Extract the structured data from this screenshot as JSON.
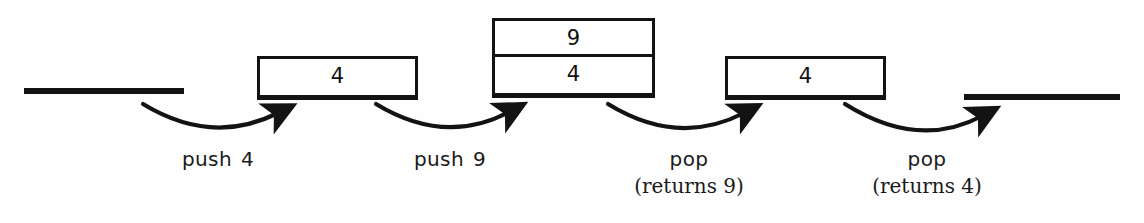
{
  "diagram": {
    "ink_color": "#131313",
    "background_color": "#ffffff",
    "states": [
      {
        "id": "empty-start",
        "kind": "baseline",
        "label": "",
        "cells": []
      },
      {
        "id": "stack-one",
        "kind": "box",
        "cells": [
          "4"
        ]
      },
      {
        "id": "stack-two",
        "kind": "box",
        "cells": [
          "9",
          "4"
        ]
      },
      {
        "id": "stack-three",
        "kind": "box",
        "cells": [
          "4"
        ]
      },
      {
        "id": "empty-end",
        "kind": "baseline",
        "label": "",
        "cells": []
      }
    ],
    "boxes": {
      "one": {
        "top": "4"
      },
      "two": {
        "top": "9",
        "bottom": "4"
      },
      "three": {
        "top": "4"
      }
    },
    "operations": [
      {
        "id": "op-1",
        "name": "push",
        "argument": "4",
        "returns": ""
      },
      {
        "id": "op-2",
        "name": "push",
        "argument": "9",
        "returns": ""
      },
      {
        "id": "op-3",
        "name": "pop",
        "argument": "",
        "returns": "(returns 9)"
      },
      {
        "id": "op-4",
        "name": "pop",
        "argument": "",
        "returns": "(returns 4)"
      }
    ]
  }
}
